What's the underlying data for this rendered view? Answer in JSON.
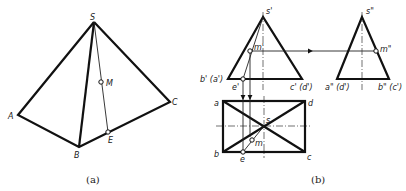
{
  "figure_a": {
    "caption": "(a)",
    "labels": {
      "S": "S",
      "A": "A",
      "B": "B",
      "C": "C",
      "M": "M",
      "E": "E"
    }
  },
  "figure_b": {
    "caption": "(b)",
    "front_view": {
      "labels": {
        "apex": "s'",
        "left_base": "b' (a')",
        "right_base": "c' (d')",
        "m": "m'",
        "e": "e'"
      }
    },
    "side_view": {
      "labels": {
        "apex": "s\"",
        "left_base": "a\" (d')",
        "right_base": "b\" (c')",
        "m": "m\""
      }
    },
    "top_view": {
      "labels": {
        "a": "a",
        "b": "b",
        "c": "c",
        "d": "d",
        "s": "s",
        "m": "m",
        "e": "e"
      }
    }
  },
  "colors": {
    "line": "#111111",
    "background": "#ffffff"
  }
}
